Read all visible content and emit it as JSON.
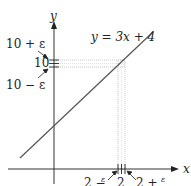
{
  "diagram": {
    "equation_label": "y = 3x + 4",
    "x_axis_label": "x",
    "y_axis_label": "y",
    "y_ticks": {
      "center": "10",
      "upper": "10 + ε",
      "lower": "10 − ε"
    },
    "x_ticks": {
      "center": "2",
      "left": "2 − ε/3",
      "right": "2 + ε/3",
      "left_main": "2 −",
      "right_main": "2 +",
      "frac_num": "ε",
      "frac_den": "3"
    },
    "colors": {
      "line": "#555555",
      "axes": "#333333",
      "band": "#bbbbbb"
    }
  }
}
